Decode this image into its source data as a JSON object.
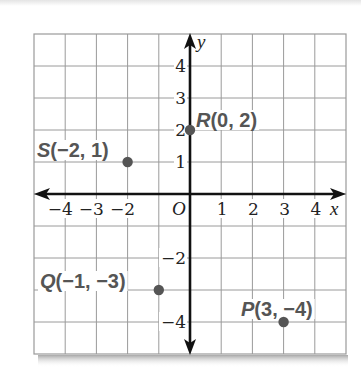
{
  "chart_data": {
    "type": "scatter",
    "title": "",
    "xlabel": "x",
    "ylabel": "y",
    "origin_label": "O",
    "xlim": [
      -5,
      5
    ],
    "ylim": [
      -5,
      5
    ],
    "grid": true,
    "x_tick_labels": [
      {
        "value": -4,
        "label": "−4"
      },
      {
        "value": -3,
        "label": "−3"
      },
      {
        "value": -2,
        "label": "−2"
      },
      {
        "value": 1,
        "label": "1"
      },
      {
        "value": 2,
        "label": "2"
      },
      {
        "value": 3,
        "label": "3"
      },
      {
        "value": 4,
        "label": "4"
      }
    ],
    "y_tick_labels": [
      {
        "value": 4,
        "label": "4"
      },
      {
        "value": 3,
        "label": "3"
      },
      {
        "value": 2,
        "label": "2"
      },
      {
        "value": 1,
        "label": "1"
      },
      {
        "value": -2,
        "label": "−2"
      },
      {
        "value": -4,
        "label": "−4"
      }
    ],
    "points": [
      {
        "name": "S",
        "x": -2,
        "y": 1,
        "label": "S(−2, 1)"
      },
      {
        "name": "R",
        "x": 0,
        "y": 2,
        "label": "R(0, 2)"
      },
      {
        "name": "Q",
        "x": -1,
        "y": -3,
        "label": "Q(−1, −3)"
      },
      {
        "name": "P",
        "x": 3,
        "y": -4,
        "label": "P(3, −4)"
      }
    ],
    "colors": {
      "grid": "#9a9a9a",
      "axis": "#111111",
      "point": "#555555",
      "point_label": "#555555"
    }
  }
}
